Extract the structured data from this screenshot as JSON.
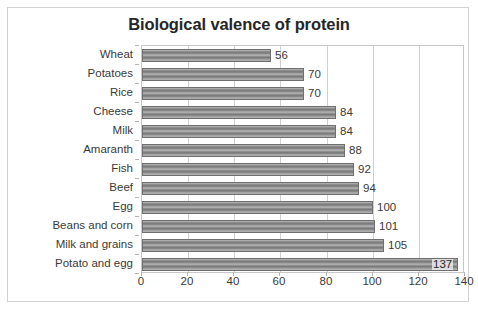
{
  "chart_data": {
    "type": "bar",
    "orientation": "horizontal",
    "title": "Biological valence of protein",
    "xlabel": "",
    "ylabel": "",
    "categories": [
      "Wheat",
      "Potatoes",
      "Rice",
      "Cheese",
      "Milk",
      "Amaranth",
      "Fish",
      "Beef",
      "Egg",
      "Beans and corn",
      "Milk and grains",
      "Potato and egg"
    ],
    "values": [
      56,
      70,
      70,
      84,
      84,
      88,
      92,
      94,
      100,
      101,
      105,
      137
    ],
    "data_labels": [
      "56",
      "70",
      "70",
      "84",
      "84",
      "88",
      "92",
      "94",
      "100",
      "101",
      "105",
      "137"
    ],
    "xlim": [
      0,
      140
    ],
    "xticks": [
      0,
      20,
      40,
      60,
      80,
      100,
      120,
      140
    ],
    "xtick_labels": [
      "0",
      "20",
      "40",
      "60",
      "80",
      "100",
      "120",
      "140"
    ],
    "grid": true,
    "grid_axis": "x",
    "legend": null,
    "bar_color": "#8f8f8f",
    "bar_border_color": "#6f6f6f",
    "title_color": "#262626",
    "axis_text_color": "#3a3a3a",
    "gridline_color": "#d0d0d0",
    "plot_border_color": "#c8c8c8",
    "frame_border_color": "#d2d2d2",
    "background_color": "#ffffff"
  }
}
